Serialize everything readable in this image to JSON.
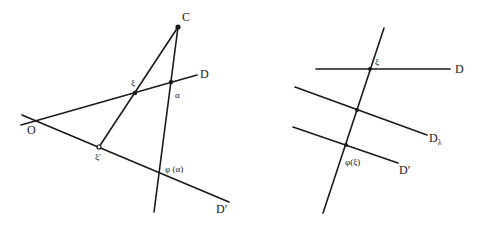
{
  "figure_left": {
    "labels": {
      "C": "C",
      "D": "D",
      "O": "O",
      "xi": "ξ",
      "alpha": "α",
      "xi_prime": "ξ′",
      "phi_alpha": "φ (α)",
      "D_prime": "D′"
    }
  },
  "figure_right": {
    "labels": {
      "xi": "ξ",
      "D": "D",
      "D_lambda_main": "D",
      "D_lambda_sub": "λ",
      "phi_xi": "φ(ξ)",
      "D_prime": "D′"
    }
  },
  "colors": {
    "ink": "#1a1a1a",
    "background": "#ffffff"
  }
}
